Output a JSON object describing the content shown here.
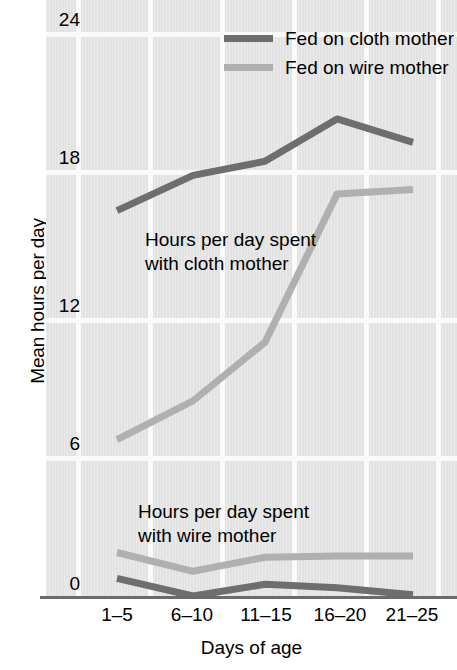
{
  "chart_data": {
    "type": "line",
    "title": "",
    "xlabel": "Days of age",
    "ylabel": "Mean hours per day",
    "categories": [
      "1–5",
      "6–10",
      "11–15",
      "16–20",
      "21–25"
    ],
    "ylim": [
      0,
      24
    ],
    "yticks": [
      0,
      6,
      12,
      18,
      24
    ],
    "ytick_labels": [
      "0",
      "6",
      "12",
      "18",
      "24"
    ],
    "grid": true,
    "legend_position": "top-center",
    "series": [
      {
        "name": "Fed on cloth mother",
        "color": "#6e6e6e",
        "region": "hours with cloth mother",
        "values": [
          16.4,
          17.9,
          18.5,
          20.3,
          19.3
        ]
      },
      {
        "name": "Fed on wire mother",
        "color": "#b0b0b0",
        "region": "hours with cloth mother",
        "values": [
          6.65,
          8.3,
          10.8,
          17.1,
          17.3
        ]
      },
      {
        "name": "Fed on wire mother",
        "color": "#b0b0b0",
        "region": "hours with wire mother",
        "values": [
          1.85,
          1.05,
          1.65,
          1.7,
          1.7
        ]
      },
      {
        "name": "Fed on cloth mother",
        "color": "#6e6e6e",
        "region": "hours with wire mother",
        "values": [
          0.75,
          0.0,
          0.5,
          0.35,
          0.05
        ]
      }
    ],
    "annotations": [
      "Hours per day spent\nwith cloth mother",
      "Hours per day spent\nwith wire mother"
    ]
  },
  "legend": {
    "items": [
      {
        "label": "Fed on cloth mother",
        "color": "#6e6e6e"
      },
      {
        "label": "Fed on wire mother",
        "color": "#b0b0b0"
      }
    ]
  },
  "axes": {
    "y_title": "Mean hours per day",
    "x_title": "Days of age",
    "y_labels": [
      "24",
      "18",
      "12",
      "6",
      "0"
    ],
    "x_labels": [
      "1–5",
      "6–10",
      "11–15",
      "16–20",
      "21–25"
    ]
  },
  "annotations": {
    "cloth": "Hours per day spent\nwith cloth mother",
    "wire": "Hours per day spent\nwith wire mother"
  }
}
